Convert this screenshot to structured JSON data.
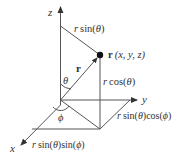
{
  "diagram": {
    "type": "spherical-coordinates",
    "colors": {
      "line": "#555555",
      "text": "#333333",
      "point": "#111111",
      "background": "#ffffff"
    },
    "axes": {
      "z": "z",
      "y": "y",
      "x": "x"
    },
    "labels": {
      "r_sin_theta_fn": "sin(",
      "theta": "θ",
      "close": ")",
      "r_var": "r",
      "r_vector": "r",
      "point_label_tail": "(x, y, z)",
      "r_cos_theta_fn": "cos(",
      "phi": "ϕ",
      "r_sin_theta_cos_phi_mid": ")cos(",
      "r_sin_theta_sin_phi_mid": ")sin("
    },
    "text": {
      "r_sin_theta": "r sin(θ)",
      "point": "r (x, y, z)",
      "r_cos_theta": "r cos(θ)",
      "r_sin_theta_cos_phi": "r sin(θ)cos(ϕ)",
      "r_sin_theta_sin_phi": "r sin(θ)sin(ϕ)",
      "theta_angle": "θ",
      "phi_angle": "ϕ",
      "vector_r": "r"
    }
  }
}
